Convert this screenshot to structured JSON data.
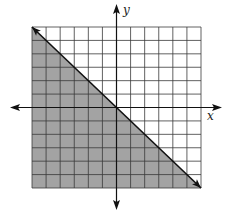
{
  "chart_data": {
    "type": "inequality-graph",
    "title": "",
    "xlabel": "x",
    "ylabel": "y",
    "xlim": [
      -6,
      6
    ],
    "ylim": [
      -6,
      6
    ],
    "grid": true,
    "grid_step": 1,
    "boundary_line": {
      "equation": "y = -x",
      "slope": -1,
      "intercept": 0,
      "style": "solid",
      "points": [
        [
          -6,
          6
        ],
        [
          0,
          0
        ],
        [
          6,
          -6
        ]
      ],
      "arrows": "both-ends"
    },
    "shaded_region": "below line",
    "inequality": "y <= -x",
    "legend": null
  },
  "style": {
    "shade_color": "#a3a3a3",
    "grid_color": "#3a3a3a",
    "line_color": "#111111",
    "axis_color": "#111111"
  },
  "labels": {
    "x_axis": "x",
    "y_axis": "y"
  }
}
